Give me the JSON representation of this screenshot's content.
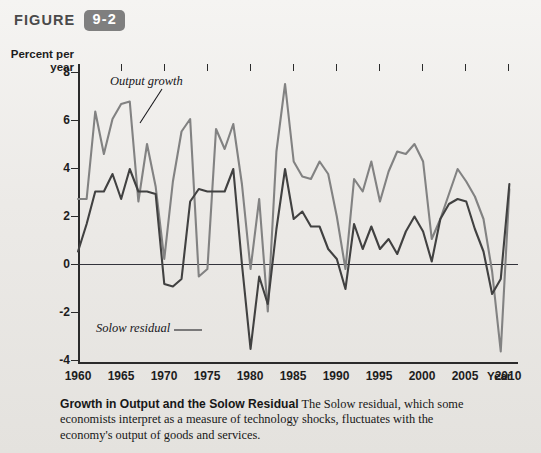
{
  "figure": {
    "label": "FIGURE",
    "number": "9-2"
  },
  "axes": {
    "y_title_line1": "Percent per",
    "y_title_line2": "year",
    "x_title": "Year",
    "y_ticks": [
      "8",
      "6",
      "4",
      "2",
      "0",
      "-2",
      "-4"
    ],
    "x_ticks": [
      "1960",
      "1965",
      "1970",
      "1975",
      "1980",
      "1985",
      "1990",
      "1995",
      "2000",
      "2005",
      "2010"
    ]
  },
  "annotations": {
    "output": "Output growth",
    "solow": "Solow residual"
  },
  "caption": {
    "title": "Growth in Output and the Solow Residual",
    "body": " The Solow residual, which some economists interpret as a measure of technology shocks, fluctuates with the economy's output of goods and services.",
    "source": ""
  },
  "colors": {
    "output_growth": "#828282",
    "solow_residual": "#414141",
    "axis": "#2b2b2b",
    "badge": "#7f7f7f",
    "page_background": "#f3f2f0"
  },
  "chart_data": {
    "type": "line",
    "title": "Growth in Output and the Solow Residual",
    "xlabel": "Year",
    "ylabel": "Percent per year",
    "xlim": [
      1960,
      2011
    ],
    "ylim": [
      -4,
      8
    ],
    "grid": false,
    "legend": "in-plot annotations",
    "x": [
      1960,
      1961,
      1962,
      1963,
      1964,
      1965,
      1966,
      1967,
      1968,
      1969,
      1970,
      1971,
      1972,
      1973,
      1974,
      1975,
      1976,
      1977,
      1978,
      1979,
      1980,
      1981,
      1982,
      1983,
      1984,
      1985,
      1986,
      1987,
      1988,
      1989,
      1990,
      1991,
      1992,
      1993,
      1994,
      1995,
      1996,
      1997,
      1998,
      1999,
      2000,
      2001,
      2002,
      2003,
      2004,
      2005,
      2006,
      2007,
      2008,
      2009,
      2010
    ],
    "series": [
      {
        "name": "Output growth",
        "color": "#828282",
        "values": [
          2.6,
          2.6,
          6.1,
          4.4,
          5.8,
          6.4,
          6.5,
          2.5,
          4.8,
          3.1,
          0.2,
          3.3,
          5.3,
          5.8,
          -0.5,
          -0.2,
          5.4,
          4.6,
          5.6,
          3.2,
          -0.2,
          2.6,
          -1.9,
          4.5,
          7.2,
          4.1,
          3.5,
          3.4,
          4.1,
          3.6,
          1.9,
          -0.2,
          3.4,
          2.9,
          4.1,
          2.5,
          3.7,
          4.5,
          4.4,
          4.8,
          4.1,
          1.0,
          1.8,
          2.8,
          3.8,
          3.3,
          2.7,
          1.8,
          -0.3,
          -3.5,
          3.0
        ]
      },
      {
        "name": "Solow residual",
        "color": "#414141",
        "values": [
          0.5,
          1.6,
          2.9,
          2.9,
          3.6,
          2.6,
          3.8,
          2.9,
          2.9,
          2.8,
          -0.8,
          -0.9,
          -0.6,
          2.5,
          3.0,
          2.9,
          2.9,
          2.9,
          3.8,
          0.0,
          -3.4,
          -0.5,
          -1.6,
          1.4,
          3.8,
          1.8,
          2.1,
          1.5,
          1.5,
          0.6,
          0.2,
          -1.0,
          1.6,
          0.6,
          1.5,
          0.6,
          1.0,
          0.4,
          1.3,
          1.9,
          1.3,
          0.1,
          1.8,
          2.4,
          2.6,
          2.5,
          1.4,
          0.5,
          -1.2,
          -0.6,
          3.2
        ]
      }
    ]
  }
}
